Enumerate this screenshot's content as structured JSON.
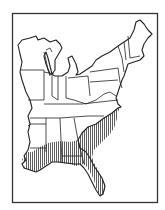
{
  "map": {
    "type": "range-map",
    "region": "Eastern United States",
    "frame_color": "#333333",
    "outline_color": "#222222",
    "hatch_color": "#333333",
    "background": "#ffffff",
    "range": {
      "description": "Southeastern coastal plain (hatched)",
      "areas": [
        "southern Louisiana",
        "southern Mississippi",
        "southern Alabama",
        "Georgia coastal plain",
        "South Carolina",
        "eastern North Carolina",
        "Florida"
      ]
    }
  }
}
